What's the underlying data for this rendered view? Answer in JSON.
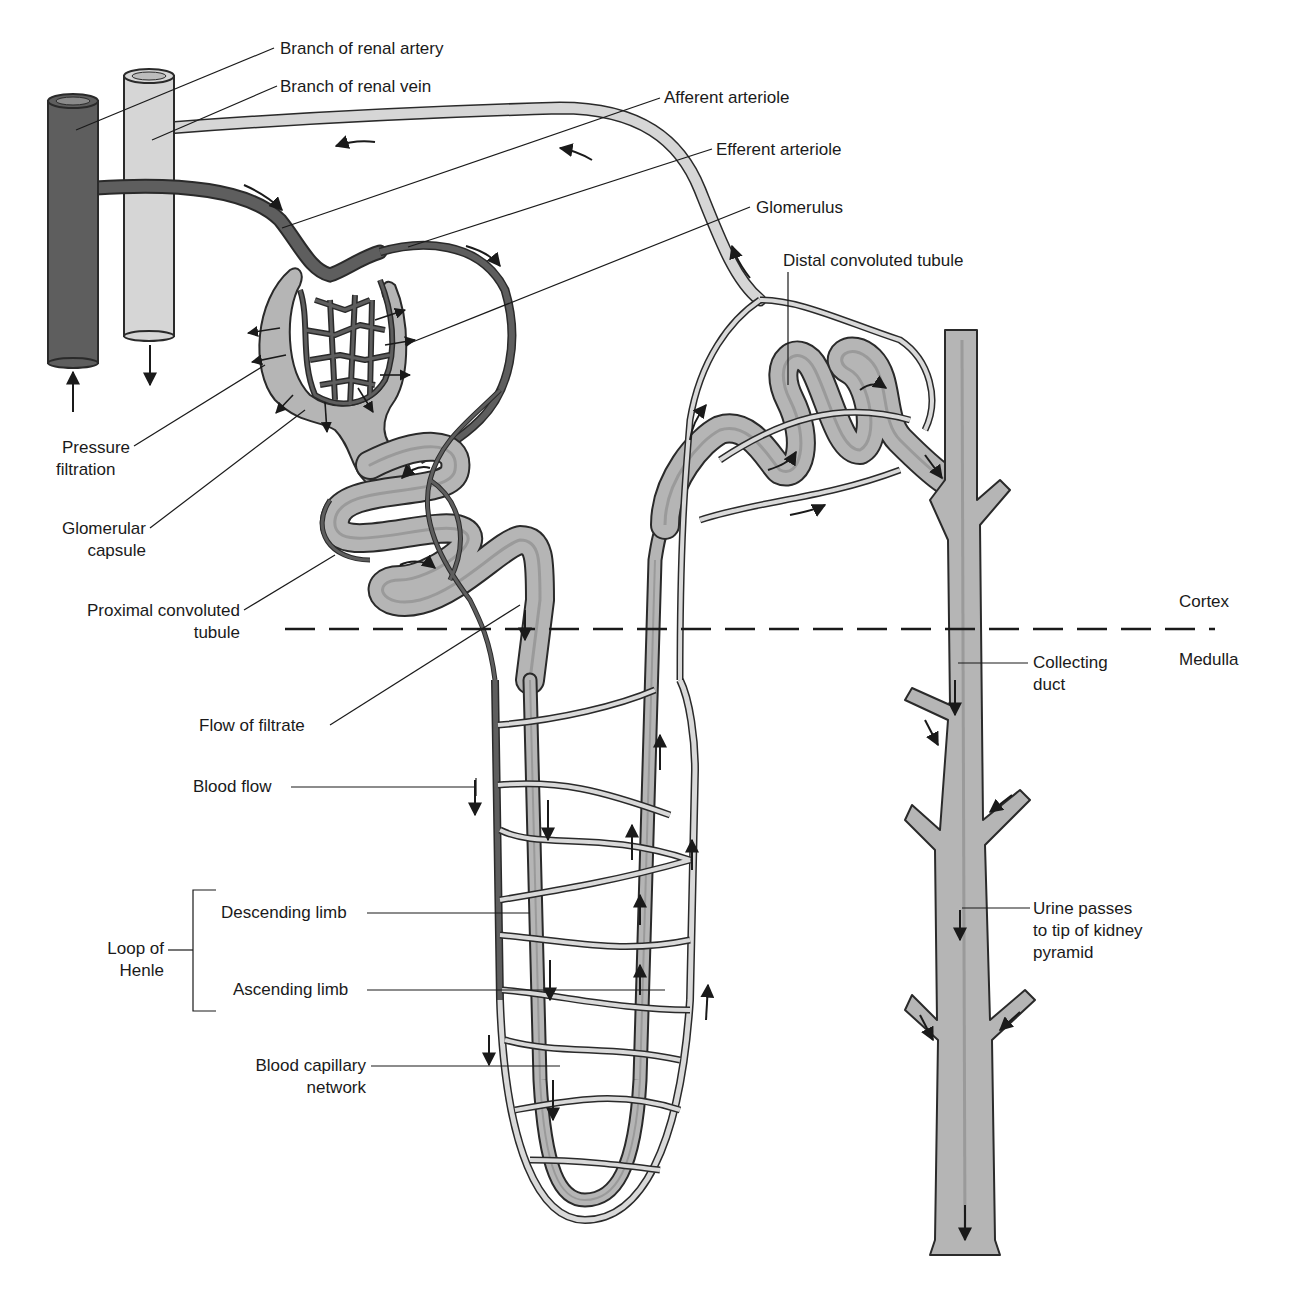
{
  "diagram": {
    "colors": {
      "artery": "#5e5e5e",
      "artery_outline": "#2a2a2a",
      "vein": "#d6d6d6",
      "tubule": "#b5b5b5",
      "tubule_lumen": "#9a9a9a",
      "capillary_light": "#d9d9d9",
      "line": "#1a1a1a",
      "background": "#ffffff"
    },
    "regions": {
      "cortex": "Cortex",
      "medulla": "Medulla"
    },
    "labels": {
      "renal_artery": "Branch of renal artery",
      "renal_vein": "Branch of renal vein",
      "afferent_arteriole": "Afferent arteriole",
      "efferent_arteriole": "Efferent arteriole",
      "glomerulus": "Glomerulus",
      "distal_tubule": "Distal convoluted tubule",
      "pressure_filtration_1": "Pressure",
      "pressure_filtration_2": "filtration",
      "glomerular_capsule_1": "Glomerular",
      "glomerular_capsule_2": "capsule",
      "proximal_tubule_1": "Proximal convoluted",
      "proximal_tubule_2": "tubule",
      "flow_of_filtrate": "Flow of filtrate",
      "blood_flow": "Blood flow",
      "loop_of_henle_1": "Loop of",
      "loop_of_henle_2": "Henle",
      "descending_limb": "Descending limb",
      "ascending_limb": "Ascending limb",
      "capillary_network_1": "Blood capillary",
      "capillary_network_2": "network",
      "collecting_duct_1": "Collecting",
      "collecting_duct_2": "duct",
      "urine_1": "Urine passes",
      "urine_2": "to tip of kidney",
      "urine_3": "pyramid"
    },
    "icons": [
      "flow-arrow-icon"
    ]
  }
}
